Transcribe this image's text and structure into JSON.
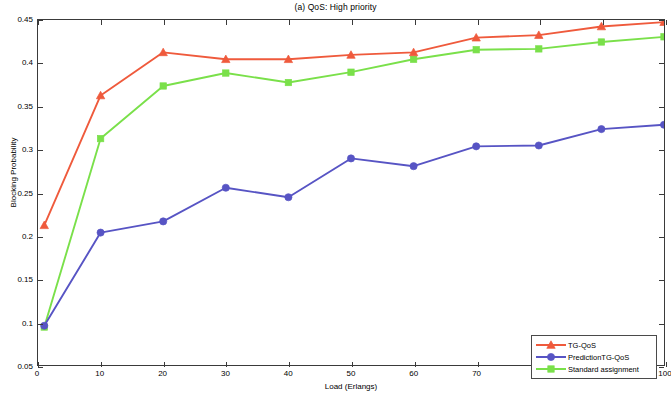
{
  "chart_data": {
    "type": "line",
    "title": "(a) QoS: High priority",
    "xlabel": "Load (Erlangs)",
    "ylabel": "Blocking Probability",
    "xlim": [
      0,
      100
    ],
    "ylim": [
      0.05,
      0.45
    ],
    "xticks": [
      0,
      10,
      20,
      30,
      40,
      50,
      60,
      70,
      80,
      90,
      100
    ],
    "yticks": [
      0.05,
      0.1,
      0.15,
      0.2,
      0.25,
      0.3,
      0.35,
      0.4,
      0.45
    ],
    "ytick_labels": [
      "0.05",
      "0.1",
      "0.15",
      "0.2",
      "0.25",
      "0.3",
      "0.35",
      "0.4",
      "0.45"
    ],
    "xtick_labels": [
      "0",
      "10",
      "20",
      "30",
      "40",
      "50",
      "60",
      "70",
      "80",
      "90",
      "100"
    ],
    "grid": false,
    "legend_position": "lower right",
    "x": [
      1,
      10,
      20,
      30,
      40,
      50,
      60,
      70,
      80,
      90,
      100
    ],
    "series": [
      {
        "name": "TG-QoS",
        "color": "#ef5a3c",
        "marker": "triangle",
        "values": [
          0.212,
          0.3625,
          0.4125,
          0.4045,
          0.4045,
          0.4095,
          0.4125,
          0.4295,
          0.4325,
          0.4425,
          0.4475
        ]
      },
      {
        "name": "PredictionTG-QoS",
        "color": "#5754c4",
        "marker": "circle",
        "values": [
          0.0955,
          0.2035,
          0.2165,
          0.2555,
          0.2445,
          0.2895,
          0.2805,
          0.3035,
          0.3045,
          0.3235,
          0.3285
        ]
      },
      {
        "name": "Standard assignment",
        "color": "#7ae04a",
        "marker": "square",
        "values": [
          0.094,
          0.3125,
          0.3735,
          0.3885,
          0.3775,
          0.3895,
          0.4045,
          0.4155,
          0.4165,
          0.4245,
          0.4305
        ]
      }
    ]
  },
  "legend": {
    "items": [
      {
        "label": "TG-QoS"
      },
      {
        "label": "PredictionTG-QoS"
      },
      {
        "label": "Standard assignment"
      }
    ]
  }
}
